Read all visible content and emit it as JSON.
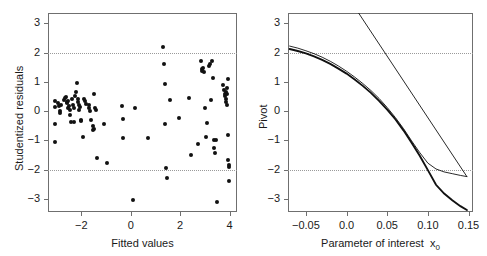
{
  "figure": {
    "panels": 2,
    "background": "#ffffff",
    "foreground": "#1a1a1a",
    "axis_color": "#6f6f6f",
    "point_color": "#111111",
    "refline_color": "#9a9a9a"
  },
  "chart_data": [
    {
      "type": "scatter",
      "title": "",
      "xlabel": "Fitted values",
      "ylabel": "Studentized residuals",
      "xlim": [
        -3.35,
        4.3
      ],
      "ylim": [
        -3.45,
        3.35
      ],
      "xticks": [
        -2,
        0,
        2,
        4
      ],
      "xticklabels": [
        "−2",
        "0",
        "2",
        "4"
      ],
      "yticks": [
        3,
        2,
        1,
        0,
        -1,
        -2,
        -3
      ],
      "yticklabels": [
        "3",
        "2",
        "1",
        "0",
        "−1",
        "−2",
        "−3"
      ],
      "grid": false,
      "legend": "none",
      "annotations": [
        {
          "type": "hline",
          "y": 2,
          "style": "dotted"
        },
        {
          "type": "hline",
          "y": -2,
          "style": "dotted"
        }
      ],
      "points": [
        [
          -3.05,
          0.33
        ],
        [
          -3.05,
          -0.44
        ],
        [
          -3.05,
          0.14
        ],
        [
          -3.05,
          -1.05
        ],
        [
          -2.95,
          0.27
        ],
        [
          -2.92,
          0.17
        ],
        [
          -2.88,
          0.02
        ],
        [
          -2.85,
          -0.07
        ],
        [
          -2.82,
          0.21
        ],
        [
          -2.62,
          0.48
        ],
        [
          -2.6,
          0.26
        ],
        [
          -2.58,
          0.3
        ],
        [
          -2.56,
          0.1
        ],
        [
          -2.54,
          0.34
        ],
        [
          -2.5,
          0.19
        ],
        [
          -2.48,
          -0.12
        ],
        [
          -2.45,
          0.05
        ],
        [
          -2.42,
          -0.38
        ],
        [
          -2.4,
          0.43
        ],
        [
          -2.35,
          0.22
        ],
        [
          -2.3,
          0.12
        ],
        [
          -2.22,
          0.66
        ],
        [
          -2.18,
          0.95
        ],
        [
          -2.15,
          0.4
        ],
        [
          -2.12,
          0.3
        ],
        [
          -2.1,
          0.2
        ],
        [
          -2.08,
          0.05
        ],
        [
          -2.05,
          0.15
        ],
        [
          -2.02,
          -0.3
        ],
        [
          -2.0,
          -0.35
        ],
        [
          -1.95,
          -0.89
        ],
        [
          -1.9,
          0.42
        ],
        [
          -1.85,
          0.33
        ],
        [
          -1.8,
          0.24
        ],
        [
          -1.7,
          0.21
        ],
        [
          -1.68,
          0.1
        ],
        [
          -1.65,
          0.02
        ],
        [
          -1.6,
          -0.32
        ],
        [
          -1.55,
          -0.65
        ],
        [
          -1.5,
          0.6
        ],
        [
          -1.45,
          0.12
        ],
        [
          -1.42,
          0.05
        ],
        [
          -1.35,
          -1.6
        ],
        [
          -1.1,
          -0.45
        ],
        [
          -0.95,
          -1.78
        ],
        [
          -0.35,
          0.18
        ],
        [
          -0.32,
          -0.27
        ],
        [
          -0.3,
          -0.93
        ],
        [
          0.1,
          -3.05
        ],
        [
          0.15,
          0.12
        ],
        [
          0.7,
          -0.93
        ],
        [
          1.3,
          2.2
        ],
        [
          1.35,
          1.62
        ],
        [
          1.38,
          0.92
        ],
        [
          1.4,
          -0.43
        ],
        [
          1.42,
          -1.95
        ],
        [
          1.45,
          -2.3
        ],
        [
          1.6,
          0.38
        ],
        [
          1.95,
          -0.23
        ],
        [
          2.35,
          0.44
        ],
        [
          2.45,
          -1.5
        ],
        [
          2.7,
          -1.12
        ],
        [
          2.85,
          1.72
        ],
        [
          2.88,
          1.45
        ],
        [
          2.9,
          1.38
        ],
        [
          2.92,
          1.48
        ],
        [
          2.95,
          1.35
        ],
        [
          3.0,
          0.1
        ],
        [
          3.05,
          -0.88
        ],
        [
          3.1,
          -0.4
        ],
        [
          3.15,
          1.55
        ],
        [
          3.2,
          1.62
        ],
        [
          3.25,
          0.38
        ],
        [
          3.3,
          1.72
        ],
        [
          3.32,
          1.12
        ],
        [
          3.35,
          -0.98
        ],
        [
          3.38,
          -1.25
        ],
        [
          3.4,
          -1.42
        ],
        [
          3.45,
          -1.0
        ],
        [
          3.5,
          -3.12
        ],
        [
          3.75,
          0.9
        ],
        [
          3.78,
          0.72
        ],
        [
          3.8,
          0.6
        ],
        [
          3.82,
          0.5
        ],
        [
          3.84,
          0.42
        ],
        [
          3.86,
          0.3
        ],
        [
          3.88,
          0.2
        ],
        [
          3.9,
          0.58
        ],
        [
          3.92,
          1.08
        ],
        [
          3.94,
          -0.82
        ],
        [
          3.95,
          -1.66
        ],
        [
          3.96,
          -1.85
        ],
        [
          3.97,
          -1.9
        ],
        [
          3.98,
          -2.4
        ],
        [
          3.9,
          0.78
        ],
        [
          3.86,
          0.66
        ],
        [
          -2.7,
          0.38
        ],
        [
          -2.66,
          0.44
        ],
        [
          -2.3,
          -0.38
        ],
        [
          -2.26,
          0.52
        ],
        [
          -1.48,
          -0.6
        ],
        [
          -1.52,
          -0.52
        ]
      ]
    },
    {
      "type": "line",
      "title": "",
      "xlabel": "Parameter of interest  x₀",
      "xlabel_main": "Parameter of interest",
      "xlabel_var": "x",
      "xlabel_sub": "0",
      "ylabel": "Pivot",
      "xlim": [
        -0.072,
        0.1555
      ],
      "ylim": [
        -3.45,
        3.35
      ],
      "xticks": [
        -0.05,
        0.0,
        0.05,
        0.1,
        0.15
      ],
      "xticklabels": [
        "−0.05",
        "0.0",
        "0.05",
        "0.10",
        "0.15"
      ],
      "yticks": [
        3,
        2,
        1,
        0,
        -1,
        -2,
        -3
      ],
      "yticklabels": [
        "3",
        "2",
        "1",
        "0",
        "−1",
        "−2",
        "−3"
      ],
      "grid": false,
      "legend": "none",
      "annotations": [
        {
          "type": "hline",
          "y": 2,
          "style": "dotted"
        },
        {
          "type": "hline",
          "y": -2,
          "style": "dotted"
        }
      ],
      "series": [
        {
          "name": "pivot-curve-thick",
          "style": "solid-thick",
          "x": [
            -0.07,
            -0.06,
            -0.05,
            -0.04,
            -0.03,
            -0.02,
            -0.01,
            0.0,
            0.01,
            0.02,
            0.03,
            0.04,
            0.05,
            0.06,
            0.07,
            0.08,
            0.09,
            0.1,
            0.11,
            0.12,
            0.13,
            0.14,
            0.148
          ],
          "values": [
            2.12,
            2.05,
            1.97,
            1.87,
            1.75,
            1.61,
            1.45,
            1.28,
            1.08,
            0.86,
            0.62,
            0.35,
            0.05,
            -0.28,
            -0.66,
            -1.08,
            -1.53,
            -2.02,
            -2.52,
            -2.82,
            -3.05,
            -3.25,
            -3.38
          ]
        },
        {
          "name": "pivot-curve-thin",
          "style": "solid-thin",
          "x": [
            -0.07,
            -0.06,
            -0.05,
            -0.04,
            -0.03,
            -0.02,
            -0.01,
            0.0,
            0.01,
            0.02,
            0.03,
            0.04,
            0.05,
            0.06,
            0.07,
            0.08,
            0.09,
            0.1,
            0.11,
            0.12,
            0.13,
            0.14,
            0.148
          ],
          "values": [
            2.22,
            2.15,
            2.06,
            1.96,
            1.84,
            1.7,
            1.54,
            1.36,
            1.16,
            0.94,
            0.7,
            0.43,
            0.12,
            -0.22,
            -0.6,
            -1.02,
            -1.42,
            -1.78,
            -1.98,
            -2.08,
            -2.14,
            -2.2,
            -2.24
          ]
        },
        {
          "name": "pivot-straight-line",
          "style": "solid-thin-straight",
          "x": [
            0.0148,
            0.148
          ],
          "values": [
            3.35,
            -2.24
          ]
        }
      ]
    }
  ]
}
